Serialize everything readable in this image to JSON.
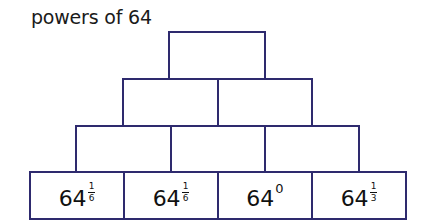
{
  "title": "powers of 64",
  "colors": {
    "line": "#2e2a6e",
    "text": "#111111",
    "background": "#ffffff"
  },
  "pyramid": {
    "rows": [
      {
        "row": 1,
        "bricks": [
          {
            "value": ""
          }
        ]
      },
      {
        "row": 2,
        "bricks": [
          {
            "value": ""
          },
          {
            "value": ""
          }
        ]
      },
      {
        "row": 3,
        "bricks": [
          {
            "value": ""
          },
          {
            "value": ""
          },
          {
            "value": ""
          }
        ]
      },
      {
        "row": 4,
        "bricks": [
          {
            "base": "64",
            "exp_num": "1",
            "exp_den": "6",
            "exp_type": "fraction"
          },
          {
            "base": "64",
            "exp_num": "1",
            "exp_den": "6",
            "exp_type": "fraction"
          },
          {
            "base": "64",
            "exp": "0",
            "exp_type": "integer"
          },
          {
            "base": "64",
            "exp_num": "1",
            "exp_den": "3",
            "exp_type": "fraction"
          }
        ]
      }
    ]
  }
}
